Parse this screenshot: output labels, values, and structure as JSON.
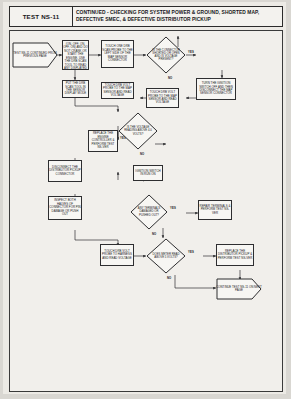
{
  "header": {
    "test_id": "TEST NS-11",
    "title_line1": "CONTINUED - CHECKING FOR SYSTEM POWER & GROUND, SHORTED MAP,",
    "title_line2": "DEFECTIVE SMEC, & DEFECTIVE DISTRIBUTOR PICKUP"
  },
  "nodes": {
    "start": "TEST NS-11 CONTINUED FROM PREVIOUS PAGE",
    "ignition_cycle": "TURN THE IGNITION ON (ON, OFF, ON, OFF, ON) AND DO NOT CRANK OR START THE ENGINE. USE THE DRB SCAN TOOL TO READ ANY DISPLAYED FAULT CODES",
    "put_drb_limp": "PUT THE DRB SCAN TOOL IN THE SENSOR DISPLAY MODE",
    "touch_drb_map": "TOUCH ONE DRB SCAN PROBE TO THE LEFT SIDE OF THE MAP SENSOR CONNECTOR",
    "touch_drb_read": "TOUCH DRB VOLT PROBE TO THE MAP SENSOR AND READ VOLTAGE",
    "turn_ign_crank": "TURN THE IGNITION SWITCH OFF AND THEN DISCONNECT THE MAP SENSOR CONNECTOR",
    "dia_connector_ok": "IS THE CONNECTOR SHORTED OR OPEN AND IS VOLTAGE PRESENT?",
    "replace_controller": "REPLACE THE ENGINE CONTROLLER & PERFORM TEST NS-VER",
    "dia_voltage_ok": "IS THE VOLTAGE READING ABOVE 4.0 VOLTS?",
    "disconnect_pickup": "DISCONNECT THE DISTRIBUTOR PICKUP CONNECTOR",
    "ignition_run": "IGNITION SWITCH IN RUN ON",
    "inspect_connector": "INSPECT BOTH HALVES OF CONNECTOR FOR PIN DAMAGE OR PUSH OUT",
    "dia_pins_damaged": "ANY TERMINALS DAMAGED OR PUSHED OUT?",
    "repair_terminals": "REPAIR TERMINALS & PERFORM TEST NS-VER",
    "touch_drb_meter": "TOUCH DRB VOLT PROBE TO HARNESS AND READ VOLTAGE",
    "dia_meter_reads": "DOES METER READ ABOVE 5 VOLTS?",
    "replace_distributor": "REPLACE THE DISTRIBUTOR PICKUP & PERFORM TEST NS-VER",
    "continue_test": "CONTINUE TEST NS-11 ON NEXT PAGE"
  },
  "branch_labels": {
    "yes": "YES",
    "no": "NO"
  }
}
